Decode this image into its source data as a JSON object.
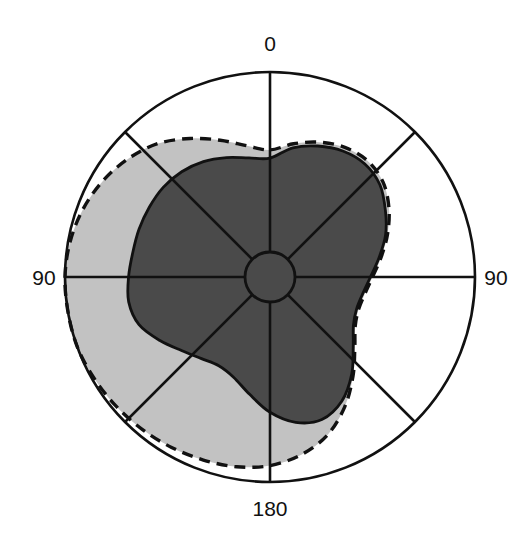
{
  "chart_data": {
    "type": "line",
    "subtype": "polar-area",
    "title": "",
    "subtitle": "",
    "xlabel": "",
    "ylabel": "",
    "grid": true,
    "legend_position": "none",
    "coordinate_system": "polar",
    "angle_unit": "degrees",
    "angle_origin": "top",
    "angle_direction": "bidirectional",
    "axis_tick_labels": [
      "0",
      "90",
      "90",
      "180"
    ],
    "axis_ticks": [
      {
        "label": "0",
        "angle_deg": 0,
        "position": "top"
      },
      {
        "label": "90",
        "angle_deg": 270,
        "position": "left"
      },
      {
        "label": "90",
        "angle_deg": 90,
        "position": "right"
      },
      {
        "label": "180",
        "angle_deg": 180,
        "position": "bottom"
      }
    ],
    "spokes_deg": [
      0,
      45,
      90,
      135,
      180,
      225,
      270,
      315
    ],
    "rlim": [
      0,
      1
    ],
    "inner_hub_r": 0.122,
    "outer_ring_r": 1.0,
    "series": [
      {
        "name": "outer-light-region",
        "fill": "#c2c2c2",
        "line_style": "dashed",
        "line_color": "#111111",
        "theta_deg": [
          0,
          10,
          20,
          30,
          40,
          50,
          60,
          70,
          80,
          90,
          100,
          110,
          120,
          130,
          140,
          150,
          160,
          170,
          180,
          190,
          200,
          210,
          220,
          230,
          240,
          250,
          260,
          270,
          280,
          290,
          300,
          310,
          320,
          330,
          340,
          350
        ],
        "r": [
          0.62,
          0.66,
          0.7,
          0.73,
          0.74,
          0.72,
          0.67,
          0.61,
          0.55,
          0.5,
          0.47,
          0.46,
          0.48,
          0.54,
          0.63,
          0.73,
          0.82,
          0.88,
          0.92,
          0.94,
          0.95,
          0.96,
          0.97,
          0.98,
          0.99,
          1.0,
          1.0,
          1.0,
          0.99,
          0.97,
          0.94,
          0.9,
          0.85,
          0.78,
          0.71,
          0.65
        ]
      },
      {
        "name": "inner-dark-region",
        "fill": "#4a4a4a",
        "line_style": "solid",
        "line_color": "#111111",
        "theta_deg": [
          0,
          10,
          20,
          30,
          40,
          50,
          60,
          70,
          80,
          90,
          100,
          110,
          120,
          130,
          140,
          150,
          160,
          170,
          180,
          190,
          200,
          210,
          220,
          230,
          240,
          250,
          260,
          270,
          280,
          290,
          300,
          310,
          320,
          330,
          340,
          350
        ],
        "r": [
          0.58,
          0.64,
          0.68,
          0.71,
          0.72,
          0.7,
          0.65,
          0.6,
          0.54,
          0.49,
          0.46,
          0.45,
          0.47,
          0.53,
          0.62,
          0.7,
          0.74,
          0.72,
          0.66,
          0.58,
          0.52,
          0.5,
          0.52,
          0.56,
          0.62,
          0.68,
          0.7,
          0.69,
          0.68,
          0.68,
          0.68,
          0.68,
          0.67,
          0.65,
          0.62,
          0.59
        ]
      }
    ],
    "colors": {
      "background": "#ffffff",
      "light_fill": "#c2c2c2",
      "dark_fill": "#4a4a4a",
      "stroke": "#111111",
      "label_text": "#111111"
    },
    "geometry": {
      "center_x": 270,
      "center_y": 277,
      "outer_radius": 205,
      "hub_radius": 25
    }
  },
  "labels": {
    "top": "0",
    "left": "90",
    "right": "90",
    "bottom": "180"
  }
}
